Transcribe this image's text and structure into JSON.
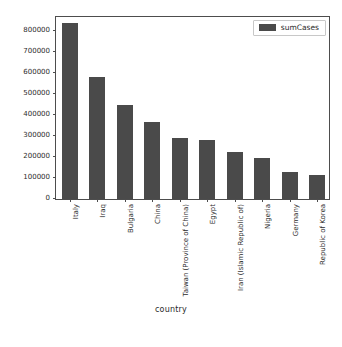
{
  "chart_data": {
    "type": "bar",
    "title": "",
    "xlabel": "country",
    "ylabel": "",
    "categories": [
      "Italy",
      "Iraq",
      "Bulgaria",
      "China",
      "Taiwan (Province of China)",
      "Egypt",
      "Iran (Islamic Republic of)",
      "Nigeria",
      "Germany",
      "Republic of Korea"
    ],
    "values": [
      842000,
      584000,
      450000,
      368000,
      292000,
      282000,
      225000,
      196000,
      129000,
      115000
    ],
    "series": [
      {
        "name": "sumCases",
        "values": [
          842000,
          584000,
          450000,
          368000,
          292000,
          282000,
          225000,
          196000,
          129000,
          115000
        ]
      }
    ],
    "ylim": [
      0,
      880000
    ],
    "yticks": [
      0,
      100000,
      200000,
      300000,
      400000,
      500000,
      600000,
      700000,
      800000
    ],
    "ytick_labels": [
      "0",
      "100000",
      "200000",
      "300000",
      "400000",
      "500000",
      "600000",
      "700000",
      "800000"
    ],
    "grid": false,
    "legend_position": "upper right",
    "bar_color": "#4a4a4a",
    "frame_color": "#4d4d4d"
  },
  "legend": {
    "entries": [
      {
        "label": "sumCases",
        "color": "#4a4a4a"
      }
    ]
  },
  "axes": {
    "xlabel": "country"
  }
}
